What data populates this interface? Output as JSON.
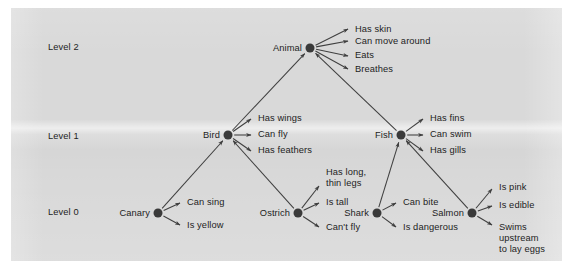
{
  "figure": {
    "background_color": "#ffffff",
    "panel_color": "#d9d9d9",
    "node_color": "#3a3a3a",
    "edge_color": "#3f3f3f",
    "text_color": "#1d1d1d"
  },
  "levels": [
    {
      "label": "Level 2",
      "x": 48,
      "y": 47
    },
    {
      "label": "Level 1",
      "x": 48,
      "y": 136
    },
    {
      "label": "Level 0",
      "x": 48,
      "y": 212
    }
  ],
  "nodes": [
    {
      "id": "animal",
      "label": "Animal",
      "x": 310,
      "y": 48,
      "level": 2
    },
    {
      "id": "bird",
      "label": "Bird",
      "x": 228,
      "y": 135,
      "level": 1
    },
    {
      "id": "fish",
      "label": "Fish",
      "x": 401,
      "y": 135,
      "level": 1
    },
    {
      "id": "canary",
      "label": "Canary",
      "x": 158,
      "y": 213,
      "level": 0
    },
    {
      "id": "ostrich",
      "label": "Ostrich",
      "x": 298,
      "y": 213,
      "level": 0
    },
    {
      "id": "shark",
      "label": "Shark",
      "x": 377,
      "y": 213,
      "level": 0
    },
    {
      "id": "salmon",
      "label": "Salmon",
      "x": 472,
      "y": 213,
      "level": 0
    }
  ],
  "isa_edges": [
    {
      "from": "bird",
      "to": "animal"
    },
    {
      "from": "fish",
      "to": "animal"
    },
    {
      "from": "canary",
      "to": "bird"
    },
    {
      "from": "ostrich",
      "to": "bird"
    },
    {
      "from": "shark",
      "to": "fish"
    },
    {
      "from": "salmon",
      "to": "fish"
    }
  ],
  "properties": [
    {
      "node": "animal",
      "text": "Has skin",
      "x": 355,
      "y": 30,
      "ax": 348,
      "ay": 29,
      "align": "mid"
    },
    {
      "node": "animal",
      "text": "Can move around",
      "x": 355,
      "y": 42,
      "ax": 348,
      "ay": 41,
      "align": "mid"
    },
    {
      "node": "animal",
      "text": "Eats",
      "x": 355,
      "y": 56,
      "ax": 348,
      "ay": 56,
      "align": "mid"
    },
    {
      "node": "animal",
      "text": "Breathes",
      "x": 355,
      "y": 70,
      "ax": 348,
      "ay": 69,
      "align": "mid"
    },
    {
      "node": "bird",
      "text": "Has wings",
      "x": 258,
      "y": 119,
      "ax": 251,
      "ay": 119,
      "align": "mid"
    },
    {
      "node": "bird",
      "text": "Can fly",
      "x": 258,
      "y": 135,
      "ax": 251,
      "ay": 135,
      "align": "mid"
    },
    {
      "node": "bird",
      "text": "Has feathers",
      "x": 258,
      "y": 151,
      "ax": 251,
      "ay": 151,
      "align": "mid"
    },
    {
      "node": "fish",
      "text": "Has fins",
      "x": 430,
      "y": 119,
      "ax": 423,
      "ay": 119,
      "align": "mid"
    },
    {
      "node": "fish",
      "text": "Can swim",
      "x": 430,
      "y": 135,
      "ax": 423,
      "ay": 135,
      "align": "mid"
    },
    {
      "node": "fish",
      "text": "Has gills",
      "x": 430,
      "y": 151,
      "ax": 423,
      "ay": 151,
      "align": "mid"
    },
    {
      "node": "canary",
      "text": "Can sing",
      "x": 187,
      "y": 203,
      "ax": 180,
      "ay": 203,
      "align": "mid"
    },
    {
      "node": "canary",
      "text": "Is yellow",
      "x": 187,
      "y": 226,
      "ax": 180,
      "ay": 225,
      "align": "mid"
    },
    {
      "node": "ostrich",
      "text": "Has long,\nthin legs",
      "x": 326,
      "y": 167,
      "ax": 319,
      "ay": 186,
      "align": "top"
    },
    {
      "node": "ostrich",
      "text": "Is tall",
      "x": 326,
      "y": 203,
      "ax": 319,
      "ay": 203,
      "align": "mid"
    },
    {
      "node": "ostrich",
      "text": "Can't fly",
      "x": 326,
      "y": 228,
      "ax": 319,
      "ay": 227,
      "align": "mid"
    },
    {
      "node": "shark",
      "text": "Can bite",
      "x": 403,
      "y": 203,
      "ax": 396,
      "ay": 203,
      "align": "mid"
    },
    {
      "node": "shark",
      "text": "Is dangerous",
      "x": 403,
      "y": 228,
      "ax": 396,
      "ay": 227,
      "align": "mid"
    },
    {
      "node": "salmon",
      "text": "Is pink",
      "x": 499,
      "y": 188,
      "ax": 492,
      "ay": 189,
      "align": "mid"
    },
    {
      "node": "salmon",
      "text": "Is edible",
      "x": 499,
      "y": 206,
      "ax": 492,
      "ay": 206,
      "align": "mid"
    },
    {
      "node": "salmon",
      "text": "Swims\nupstream\nto lay eggs",
      "x": 499,
      "y": 222,
      "ax": 492,
      "ay": 225,
      "align": "top"
    }
  ]
}
